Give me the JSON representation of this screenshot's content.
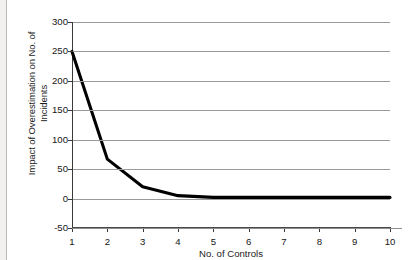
{
  "chart_data": {
    "type": "line",
    "title": "",
    "xlabel": "No. of Controls",
    "ylabel": "Impact of Overestimation on No. of\nIncidents",
    "x": [
      1,
      2,
      3,
      4,
      5,
      6,
      7,
      8,
      9,
      10
    ],
    "series": [
      {
        "name": "Impact of Overestimation",
        "values": [
          250,
          67,
          20,
          5,
          2,
          2,
          2,
          2,
          2,
          2
        ]
      }
    ],
    "xlim": [
      1,
      10
    ],
    "ylim": [
      -50,
      300
    ],
    "xticks": [
      "1",
      "2",
      "3",
      "4",
      "5",
      "6",
      "7",
      "8",
      "9",
      "10"
    ],
    "yticks": [
      "-50",
      "0",
      "50",
      "100",
      "150",
      "200",
      "250",
      "300"
    ],
    "ytick_values": [
      -50,
      0,
      50,
      100,
      150,
      200,
      250,
      300
    ],
    "grid": true,
    "grid_axis": "y",
    "legend": false,
    "legend_position": "none",
    "line_color": "#000000",
    "grid_color": "#9a9a9a",
    "background_color": "#ffffff"
  }
}
